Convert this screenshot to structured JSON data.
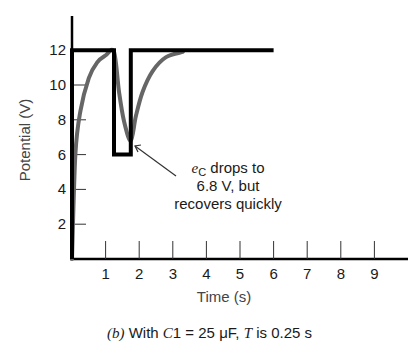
{
  "chart_data": {
    "type": "line",
    "title": "",
    "xlabel": "Time (s)",
    "ylabel": "Potential (V)",
    "xlim": [
      0,
      10
    ],
    "ylim": [
      0,
      13
    ],
    "x_ticks": [
      1,
      2,
      3,
      4,
      5,
      6,
      7,
      8,
      9
    ],
    "y_ticks": [
      2,
      4,
      6,
      8,
      10,
      12
    ],
    "grid": false,
    "legend": null,
    "series": [
      {
        "name": "input square pulse",
        "style": "thick black",
        "x": [
          0,
          0,
          1.25,
          1.25,
          1.75,
          1.75,
          6.0
        ],
        "y": [
          0,
          12,
          12,
          6,
          6,
          12,
          12
        ]
      },
      {
        "name": "e_C (capacitor voltage)",
        "style": "gray curve",
        "x": [
          0,
          0.1,
          0.25,
          0.5,
          0.75,
          1.0,
          1.25,
          1.4,
          1.55,
          1.75,
          1.9,
          2.1,
          2.4,
          2.8,
          3.3
        ],
        "y": [
          0,
          6,
          8.5,
          10.4,
          11.3,
          11.7,
          11.9,
          9.6,
          7.9,
          6.8,
          8.2,
          9.6,
          10.8,
          11.6,
          11.9
        ]
      }
    ],
    "annotations": [
      {
        "text_line1_symbol": "e",
        "text_line1_subscript": "C",
        "text_line1_rest": " drops to",
        "text_line2": "6.8 V, but",
        "text_line3": "recovers quickly",
        "arrow_to": [
          1.75,
          6.8
        ]
      }
    ],
    "caption": {
      "part": "(b)",
      "text_pre": " With ",
      "var1": "C",
      "var1_rest": "1 = 25 μF, ",
      "var2": "T",
      "text_post": " is 0.25 s"
    }
  }
}
